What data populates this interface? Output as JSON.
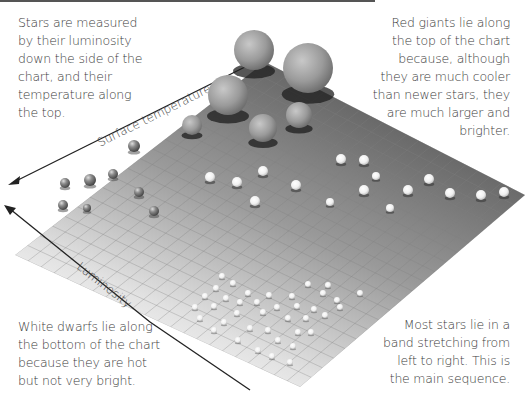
{
  "notes": {
    "top_left": [
      "Stars are measured",
      "by their luminosity",
      "down the side of the",
      "chart, and their",
      "temperature along",
      "the top."
    ],
    "top_right": [
      "Red giants lie along",
      "the top of the chart",
      "because, although",
      "they are much cooler",
      "than newer stars, they",
      "are much larger and",
      "brighter."
    ],
    "bottom_left": [
      "White dwarfs lie along",
      "the bottom of the chart",
      "because they are hot",
      "but not very bright."
    ],
    "bottom_right": [
      "Most stars lie in a",
      "band stretching from",
      "left to right. This is",
      "the main sequence."
    ]
  },
  "axes": {
    "top_axis_label": "Surface temperature",
    "side_axis_label": "Luminosity"
  },
  "colors": {
    "plane_dark": "#6e6e6e",
    "plane_light": "#f2f2f2",
    "grid": "#8a8a8a",
    "arrow": "#222222",
    "text": "#3d3d3d"
  },
  "stars": {
    "giants": [
      {
        "x": 254,
        "y": 50,
        "r": 20
      },
      {
        "x": 308,
        "y": 68,
        "r": 25
      },
      {
        "x": 228,
        "y": 95,
        "r": 20
      },
      {
        "x": 263,
        "y": 128,
        "r": 14
      },
      {
        "x": 299,
        "y": 115,
        "r": 13
      },
      {
        "x": 192,
        "y": 125,
        "r": 10
      }
    ],
    "cool_small": [
      {
        "x": 134,
        "y": 146,
        "r": 6
      },
      {
        "x": 65,
        "y": 183,
        "r": 5
      },
      {
        "x": 90,
        "y": 180,
        "r": 6
      },
      {
        "x": 113,
        "y": 174,
        "r": 5
      },
      {
        "x": 139,
        "y": 192,
        "r": 5
      },
      {
        "x": 63,
        "y": 205,
        "r": 5
      },
      {
        "x": 87,
        "y": 208,
        "r": 4
      },
      {
        "x": 154,
        "y": 211,
        "r": 5
      }
    ],
    "main_sequence": [
      {
        "x": 210,
        "y": 177,
        "r": 5
      },
      {
        "x": 237,
        "y": 182,
        "r": 5
      },
      {
        "x": 263,
        "y": 171,
        "r": 5
      },
      {
        "x": 255,
        "y": 201,
        "r": 5
      },
      {
        "x": 296,
        "y": 185,
        "r": 5
      },
      {
        "x": 341,
        "y": 159,
        "r": 5
      },
      {
        "x": 364,
        "y": 160,
        "r": 5
      },
      {
        "x": 376,
        "y": 176,
        "r": 4
      },
      {
        "x": 364,
        "y": 190,
        "r": 5
      },
      {
        "x": 330,
        "y": 202,
        "r": 4
      },
      {
        "x": 408,
        "y": 190,
        "r": 5
      },
      {
        "x": 429,
        "y": 179,
        "r": 5
      },
      {
        "x": 390,
        "y": 208,
        "r": 4
      },
      {
        "x": 450,
        "y": 193,
        "r": 5
      },
      {
        "x": 481,
        "y": 195,
        "r": 5
      },
      {
        "x": 504,
        "y": 192,
        "r": 5
      }
    ],
    "white_dwarfs": [
      {
        "x": 222,
        "y": 276,
        "r": 3
      },
      {
        "x": 233,
        "y": 283,
        "r": 3
      },
      {
        "x": 216,
        "y": 288,
        "r": 3
      },
      {
        "x": 248,
        "y": 293,
        "r": 3
      },
      {
        "x": 269,
        "y": 295,
        "r": 3
      },
      {
        "x": 308,
        "y": 284,
        "r": 3
      },
      {
        "x": 323,
        "y": 293,
        "r": 3
      },
      {
        "x": 337,
        "y": 300,
        "r": 3
      },
      {
        "x": 360,
        "y": 293,
        "r": 3
      },
      {
        "x": 292,
        "y": 296,
        "r": 3
      },
      {
        "x": 205,
        "y": 296,
        "r": 3
      },
      {
        "x": 226,
        "y": 298,
        "r": 3
      },
      {
        "x": 240,
        "y": 302,
        "r": 3
      },
      {
        "x": 257,
        "y": 302,
        "r": 3
      },
      {
        "x": 277,
        "y": 307,
        "r": 3
      },
      {
        "x": 297,
        "y": 306,
        "r": 3
      },
      {
        "x": 314,
        "y": 309,
        "r": 3
      },
      {
        "x": 340,
        "y": 307,
        "r": 3
      },
      {
        "x": 195,
        "y": 307,
        "r": 3
      },
      {
        "x": 214,
        "y": 306,
        "r": 3
      },
      {
        "x": 237,
        "y": 313,
        "r": 3
      },
      {
        "x": 263,
        "y": 312,
        "r": 3
      },
      {
        "x": 288,
        "y": 318,
        "r": 3
      },
      {
        "x": 306,
        "y": 318,
        "r": 3
      },
      {
        "x": 325,
        "y": 315,
        "r": 3
      },
      {
        "x": 224,
        "y": 322,
        "r": 3
      },
      {
        "x": 200,
        "y": 318,
        "r": 3
      },
      {
        "x": 250,
        "y": 328,
        "r": 3
      },
      {
        "x": 268,
        "y": 330,
        "r": 3
      },
      {
        "x": 298,
        "y": 332,
        "r": 3
      },
      {
        "x": 278,
        "y": 340,
        "r": 3
      },
      {
        "x": 293,
        "y": 346,
        "r": 3
      },
      {
        "x": 311,
        "y": 332,
        "r": 3
      },
      {
        "x": 258,
        "y": 350,
        "r": 3
      },
      {
        "x": 272,
        "y": 356,
        "r": 3
      },
      {
        "x": 290,
        "y": 362,
        "r": 3
      },
      {
        "x": 214,
        "y": 330,
        "r": 3
      },
      {
        "x": 238,
        "y": 340,
        "r": 3
      },
      {
        "x": 328,
        "y": 285,
        "r": 3
      }
    ]
  }
}
